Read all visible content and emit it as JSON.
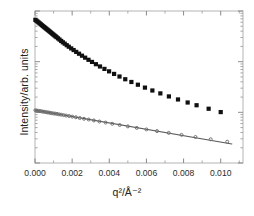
{
  "chart_data": {
    "type": "scatter",
    "title": "",
    "subtitle": "",
    "xlabel": "q2/A-2",
    "xlabel_display": "q²/Å⁻²",
    "ylabel": "Intensity/arb. units",
    "grid": false,
    "legend": "none",
    "xlim": [
      0.0,
      0.0112
    ],
    "ylim": [
      0.0,
      1.0
    ],
    "y_axis_scale": "log",
    "y_tick_labels": [],
    "y_ticks_labeled": false,
    "x_tick_labels": [
      "0.000",
      "0.002",
      "0.004",
      "0.006",
      "0.008",
      "0.010"
    ],
    "x_tick_values": [
      0.0,
      0.002,
      0.004,
      0.006,
      0.008,
      0.01
    ],
    "x_minor_ticks_per_interval": 1,
    "series": [
      {
        "name": "upper-dataset",
        "marker": "filled-square",
        "marker_color": "#101010",
        "marker_size_px": 4.2,
        "line": false,
        "x": [
          2e-05,
          8e-05,
          0.00014,
          0.0002,
          0.00026,
          0.00032,
          0.00038,
          0.00044,
          0.0005,
          0.00056,
          0.00062,
          0.00068,
          0.00074,
          0.0008,
          0.00086,
          0.00092,
          0.00098,
          0.00104,
          0.0011,
          0.00116,
          0.00124,
          0.00132,
          0.00141,
          0.0015,
          0.0016,
          0.00171,
          0.00182,
          0.00195,
          0.00208,
          0.00222,
          0.00237,
          0.00253,
          0.0027,
          0.00288,
          0.00307,
          0.00328,
          0.0035,
          0.00374,
          0.00399,
          0.00426,
          0.00455,
          0.00486,
          0.00519,
          0.00554,
          0.00592,
          0.00632,
          0.00675,
          0.00721,
          0.0077,
          0.00822,
          0.0087,
          0.00935,
          0.01
        ],
        "y": [
          0.942,
          0.936,
          0.93,
          0.924,
          0.918,
          0.912,
          0.906,
          0.9,
          0.894,
          0.888,
          0.882,
          0.876,
          0.87,
          0.864,
          0.858,
          0.852,
          0.846,
          0.84,
          0.834,
          0.828,
          0.82,
          0.812,
          0.803,
          0.794,
          0.785,
          0.775,
          0.765,
          0.754,
          0.743,
          0.731,
          0.719,
          0.706,
          0.693,
          0.679,
          0.665,
          0.65,
          0.635,
          0.619,
          0.603,
          0.586,
          0.569,
          0.551,
          0.533,
          0.515,
          0.496,
          0.477,
          0.458,
          0.438,
          0.418,
          0.398,
          0.38,
          0.357,
          0.335
        ]
      },
      {
        "name": "lower-dataset",
        "marker": "open-circle",
        "marker_color": "#6e6e6e",
        "marker_size_px": 3.0,
        "line": true,
        "line_color": "#5a5a5a",
        "line_width_px": 1.1,
        "fit_line": {
          "x0": 0.0,
          "y0": 0.348,
          "x1": 0.0106,
          "y1": 0.125
        },
        "x": [
          2e-05,
          0.0001,
          0.00018,
          0.00026,
          0.00034,
          0.00042,
          0.0005,
          0.00058,
          0.00066,
          0.00074,
          0.00082,
          0.0009,
          0.00099,
          0.00108,
          0.00118,
          0.00129,
          0.00141,
          0.00154,
          0.00168,
          0.00184,
          0.00201,
          0.0022,
          0.00241,
          0.00264,
          0.00289,
          0.00317,
          0.00347,
          0.0038,
          0.00416,
          0.00456,
          0.005,
          0.00548,
          0.006,
          0.00657,
          0.0072,
          0.00789,
          0.00864,
          0.00946,
          0.01035
        ],
        "y": [
          0.347,
          0.345,
          0.343,
          0.342,
          0.34,
          0.338,
          0.337,
          0.335,
          0.333,
          0.332,
          0.33,
          0.328,
          0.326,
          0.325,
          0.323,
          0.32,
          0.318,
          0.315,
          0.312,
          0.309,
          0.305,
          0.301,
          0.296,
          0.291,
          0.286,
          0.28,
          0.273,
          0.266,
          0.258,
          0.25,
          0.241,
          0.231,
          0.221,
          0.21,
          0.198,
          0.185,
          0.171,
          0.156,
          0.14
        ]
      }
    ]
  },
  "axes": {
    "frame_color": "#b4b4b4",
    "background": "#ffffff"
  }
}
